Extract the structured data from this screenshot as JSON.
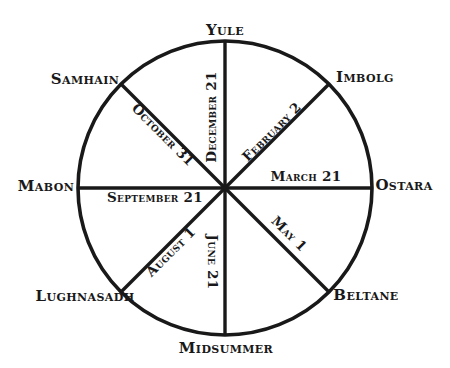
{
  "diagram": {
    "type": "radial-wheel",
    "background_color": "#ffffff",
    "line_color": "#191919",
    "text_color": "#191919"
  },
  "geometry": {
    "center_x": 225,
    "center_y": 188,
    "radius": 147,
    "stroke_width": 3.5,
    "spoke_count": 8
  },
  "festivals": [
    {
      "name": "Yule",
      "position": "top",
      "angle_deg": 0,
      "date": "December 21",
      "date_rotation": -90
    },
    {
      "name": "Imbolg",
      "position": "upper-right",
      "angle_deg": 45,
      "date": "February 2",
      "date_rotation": -45
    },
    {
      "name": "Ostara",
      "position": "right",
      "angle_deg": 90,
      "date": "March 21",
      "date_rotation": 0
    },
    {
      "name": "Beltane",
      "position": "lower-right",
      "angle_deg": 135,
      "date": "May 1",
      "date_rotation": 45
    },
    {
      "name": "Midsummer",
      "position": "bottom",
      "angle_deg": 180,
      "date": "June 21",
      "date_rotation": 90
    },
    {
      "name": "Lughnasadh",
      "position": "lower-left",
      "angle_deg": 225,
      "date": "August 1",
      "date_rotation": -45
    },
    {
      "name": "Mabon",
      "position": "left",
      "angle_deg": 270,
      "date": "September 21",
      "date_rotation": 0
    },
    {
      "name": "Samhain",
      "position": "upper-left",
      "angle_deg": 315,
      "date": "October 31",
      "date_rotation": 45
    }
  ],
  "labels": {
    "yule": "Yule",
    "imbolg": "Imbolg",
    "ostara": "Ostara",
    "beltane": "Beltane",
    "midsummer": "Midsummer",
    "lughnasadh": "Lughnasadh",
    "mabon": "Mabon",
    "samhain": "Samhain",
    "december_21": "December 21",
    "february_2": "February 2",
    "march_21": "March 21",
    "may_1": "May 1",
    "june_21": "June 21",
    "august_1": "August 1",
    "september_21": "September 21",
    "october_31": "October 31"
  }
}
